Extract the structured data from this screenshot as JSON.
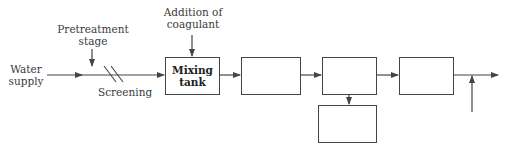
{
  "diagram": {
    "type": "process-flow",
    "labels": {
      "water_supply_line1": "Water",
      "water_supply_line2": "supply",
      "pretreatment_line1": "Pretreatment",
      "pretreatment_line2": "stage",
      "screening": "Screening",
      "coagulant_line1": "Addition of",
      "coagulant_line2": "coagulant"
    },
    "boxes": [
      {
        "id": "mixing-tank",
        "label_line1": "Mixing",
        "label_line2": "tank"
      },
      {
        "id": "box-2",
        "label_line1": "",
        "label_line2": ""
      },
      {
        "id": "box-3",
        "label_line1": "",
        "label_line2": ""
      },
      {
        "id": "box-4",
        "label_line1": "",
        "label_line2": ""
      },
      {
        "id": "box-5-below",
        "label_line1": "",
        "label_line2": ""
      }
    ],
    "colors": {
      "line": "#444444",
      "text": "#333333"
    }
  }
}
